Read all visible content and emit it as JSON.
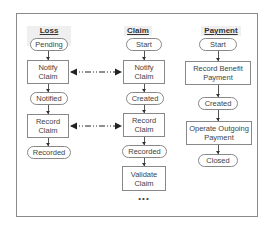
{
  "diagram": {
    "lanes": [
      {
        "title": "Loss Event",
        "nodes": [
          {
            "type": "state",
            "label": "Pending"
          },
          {
            "type": "activity",
            "label": "Notify Claim"
          },
          {
            "type": "state",
            "label": "Notified"
          },
          {
            "type": "activity",
            "label": "Record Claim"
          },
          {
            "type": "state",
            "label": "Recorded"
          }
        ]
      },
      {
        "title": "Claim",
        "nodes": [
          {
            "type": "state",
            "label": "Start"
          },
          {
            "type": "activity",
            "label": "Notify Claim"
          },
          {
            "type": "state",
            "label": "Created"
          },
          {
            "type": "activity",
            "label": "Record Claim"
          },
          {
            "type": "state",
            "label": "Recorded"
          },
          {
            "type": "activity",
            "label": "Validate Claim"
          }
        ],
        "continuation": "•••"
      },
      {
        "title": "Payment",
        "nodes": [
          {
            "type": "state",
            "label": "Start"
          },
          {
            "type": "activity",
            "label": "Record Benefit Payment"
          },
          {
            "type": "state",
            "label": "Created"
          },
          {
            "type": "activity",
            "label": "Operate Outgoing Payment"
          },
          {
            "type": "state",
            "label": "Closed"
          }
        ]
      }
    ],
    "links": [
      {
        "from": "Loss Event: Notify Claim",
        "to": "Claim: Notify Claim",
        "style": "dash-dot bidirectional"
      },
      {
        "from": "Loss Event: Record Claim",
        "to": "Claim: Record Claim",
        "style": "dash-dot bidirectional"
      }
    ]
  }
}
